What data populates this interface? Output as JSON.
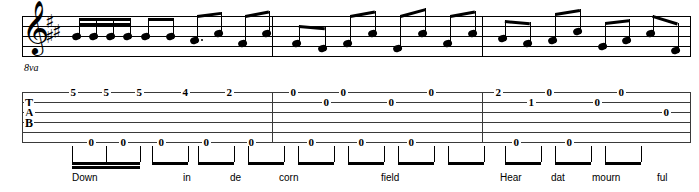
{
  "score": {
    "title": "Guitar tablature with standard notation and lyrics",
    "clef": "treble-8vb",
    "clef_glyph": "𝄞",
    "ottava_label": "8va",
    "key_signature": {
      "accidental": "♯",
      "count": 3,
      "key": "A major"
    },
    "staff_lines": 5,
    "tab_lines": 6,
    "tab_clef_letters": [
      "T",
      "A",
      "B"
    ],
    "measures": 3,
    "barline_x": [
      272,
      482,
      690
    ]
  },
  "tab": {
    "notes": [
      {
        "x": 72,
        "string": 1,
        "fret": "5"
      },
      {
        "x": 105,
        "string": 1,
        "fret": "5"
      },
      {
        "x": 138,
        "string": 1,
        "fret": "5"
      },
      {
        "x": 184,
        "string": 1,
        "fret": "4"
      },
      {
        "x": 228,
        "string": 1,
        "fret": "2"
      },
      {
        "x": 292,
        "string": 1,
        "fret": "0"
      },
      {
        "x": 325,
        "string": 2,
        "fret": "0"
      },
      {
        "x": 342,
        "string": 1,
        "fret": "0"
      },
      {
        "x": 390,
        "string": 2,
        "fret": "0"
      },
      {
        "x": 430,
        "string": 1,
        "fret": "0"
      },
      {
        "x": 497,
        "string": 1,
        "fret": "2"
      },
      {
        "x": 530,
        "string": 2,
        "fret": "1"
      },
      {
        "x": 548,
        "string": 1,
        "fret": "0"
      },
      {
        "x": 596,
        "string": 2,
        "fret": "0"
      },
      {
        "x": 620,
        "string": 1,
        "fret": "0"
      },
      {
        "x": 665,
        "string": 3,
        "fret": "0"
      },
      {
        "x": 90,
        "string": 6,
        "fret": "0"
      },
      {
        "x": 122,
        "string": 6,
        "fret": "0"
      },
      {
        "x": 160,
        "string": 6,
        "fret": "0"
      },
      {
        "x": 205,
        "string": 6,
        "fret": "0"
      },
      {
        "x": 250,
        "string": 6,
        "fret": "0"
      },
      {
        "x": 310,
        "string": 6,
        "fret": "0"
      },
      {
        "x": 360,
        "string": 6,
        "fret": "0"
      },
      {
        "x": 410,
        "string": 6,
        "fret": "0"
      },
      {
        "x": 515,
        "string": 6,
        "fret": "0"
      },
      {
        "x": 568,
        "string": 6,
        "fret": "0"
      }
    ]
  },
  "notation": {
    "notes": [
      {
        "x": 72,
        "y": 36,
        "beamgroup": 0
      },
      {
        "x": 89,
        "y": 36,
        "beamgroup": 0
      },
      {
        "x": 106,
        "y": 36,
        "beamgroup": 0
      },
      {
        "x": 123,
        "y": 36,
        "beamgroup": 0
      },
      {
        "x": 141,
        "y": 36,
        "beamgroup": 1
      },
      {
        "x": 166,
        "y": 36,
        "beamgroup": 1
      },
      {
        "x": 190,
        "y": 40,
        "beamgroup": 2,
        "dotted": true
      },
      {
        "x": 214,
        "y": 33,
        "beamgroup": 2
      },
      {
        "x": 238,
        "y": 43,
        "beamgroup": 3
      },
      {
        "x": 262,
        "y": 33,
        "beamgroup": 3
      },
      {
        "x": 292,
        "y": 43,
        "beamgroup": 4
      },
      {
        "x": 318,
        "y": 48,
        "beamgroup": 4
      },
      {
        "x": 343,
        "y": 43,
        "beamgroup": 5
      },
      {
        "x": 368,
        "y": 33,
        "beamgroup": 5
      },
      {
        "x": 393,
        "y": 48,
        "beamgroup": 6
      },
      {
        "x": 418,
        "y": 33,
        "beamgroup": 6
      },
      {
        "x": 443,
        "y": 43,
        "beamgroup": 7
      },
      {
        "x": 468,
        "y": 33,
        "beamgroup": 7
      },
      {
        "x": 498,
        "y": 38,
        "beamgroup": 8
      },
      {
        "x": 523,
        "y": 43,
        "beamgroup": 8
      },
      {
        "x": 548,
        "y": 40,
        "beamgroup": 9
      },
      {
        "x": 573,
        "y": 31,
        "beamgroup": 9
      },
      {
        "x": 598,
        "y": 46,
        "beamgroup": 10
      },
      {
        "x": 622,
        "y": 40,
        "beamgroup": 10
      },
      {
        "x": 646,
        "y": 33,
        "beamgroup": 11
      },
      {
        "x": 671,
        "y": 50,
        "beamgroup": 11
      }
    ]
  },
  "rhythm": {
    "groups": [
      {
        "x1": 72,
        "x2": 140,
        "double": true
      },
      {
        "x1": 152,
        "x2": 188,
        "double": false
      },
      {
        "x1": 198,
        "x2": 234,
        "double": false
      },
      {
        "x1": 248,
        "x2": 284,
        "double": false
      },
      {
        "x1": 298,
        "x2": 334,
        "double": false
      },
      {
        "x1": 348,
        "x2": 384,
        "double": false
      },
      {
        "x1": 398,
        "x2": 434,
        "double": false
      },
      {
        "x1": 448,
        "x2": 484,
        "double": false
      },
      {
        "x1": 505,
        "x2": 541,
        "double": false
      },
      {
        "x1": 555,
        "x2": 591,
        "double": false
      },
      {
        "x1": 605,
        "x2": 641,
        "double": false
      }
    ]
  },
  "lyrics": [
    {
      "x": 72,
      "text": "Down"
    },
    {
      "x": 183,
      "text": "in"
    },
    {
      "x": 230,
      "text": "de"
    },
    {
      "x": 279,
      "text": "corn"
    },
    {
      "x": 381,
      "text": "field"
    },
    {
      "x": 500,
      "text": "Hear"
    },
    {
      "x": 551,
      "text": "dat"
    },
    {
      "x": 592,
      "text": "mourn"
    },
    {
      "x": 657,
      "text": "ful"
    }
  ]
}
